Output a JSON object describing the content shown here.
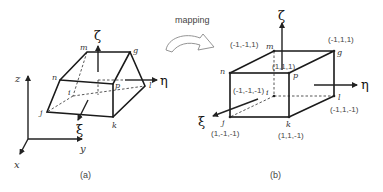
{
  "figure": {
    "mapping_label": "mapping",
    "panels": [
      {
        "id": "a",
        "caption": "(a)",
        "description": "distorted hexahedral element in global coordinates",
        "nodes": {
          "m": "m",
          "g": "g",
          "n": "n",
          "p": "p",
          "i": "i",
          "l": "l",
          "j": "j",
          "k": "k"
        },
        "local_axes": {
          "zeta": "ζ",
          "eta": "η",
          "xi": "ξ"
        },
        "global_axes": {
          "z": "z",
          "y": "y",
          "x": "x"
        }
      },
      {
        "id": "b",
        "caption": "(b)",
        "description": "parent cube element in natural coordinates",
        "nodes": {
          "m": "m",
          "g": "g",
          "n": "n",
          "p": "p",
          "i": "i",
          "l": "l",
          "j": "j",
          "k": "k"
        },
        "coordinates": {
          "m": "(-1,-1,1)",
          "g": "(-1,1,1)",
          "p": "(1,1,1)",
          "i": "(-1,-1,-1)",
          "l": "(-1,1,-1)",
          "j": "(1,-1,-1)",
          "k": "(1,1,-1)"
        },
        "local_axes": {
          "zeta": "ζ",
          "eta": "η",
          "xi": "ξ"
        }
      }
    ],
    "colors": {
      "line": "#1a1a1a",
      "text": "#444444",
      "arrow_outline": "#888888"
    }
  }
}
